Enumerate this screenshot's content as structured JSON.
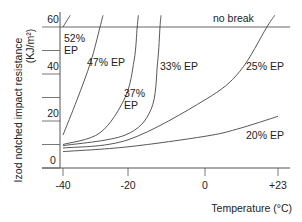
{
  "chart_data": {
    "type": "line",
    "title": "",
    "xlabel": "Temperature (°C)",
    "ylabel": "Izod notched impact resistance",
    "ylabel_unit": "(KJ/m²)",
    "x_ticks": [
      -40,
      -20,
      0,
      23
    ],
    "x_tick_labels": [
      "-40",
      "-20",
      "0",
      "+23"
    ],
    "y_ticks": [
      0,
      10,
      20,
      30,
      40,
      50,
      60
    ],
    "y_tick_labels": [
      "0",
      "",
      "20",
      "",
      "40",
      "",
      "60"
    ],
    "xlim": [
      -40,
      23
    ],
    "ylim": [
      0,
      60
    ],
    "grid": false,
    "legend": "none (inline labels)",
    "annotations": [
      {
        "text": "no break",
        "note": "horizontal line at 60 KJ/m² marks no-break threshold"
      }
    ],
    "series": [
      {
        "name": "52% EP",
        "label_lines": [
          "52%",
          "EP"
        ],
        "points": [
          [
            -40,
            60
          ],
          [
            -37.8,
            65
          ]
        ]
      },
      {
        "name": "47% EP",
        "label_lines": [
          "47% EP"
        ],
        "points": [
          [
            -40,
            14
          ],
          [
            -35.7,
            29
          ],
          [
            -31.5,
            45
          ],
          [
            -28.6,
            60
          ],
          [
            -27.7,
            65
          ]
        ]
      },
      {
        "name": "37% EP",
        "label_lines": [
          "37%",
          "EP"
        ],
        "points": [
          [
            -40,
            10
          ],
          [
            -28.6,
            15
          ],
          [
            -20.9,
            30
          ],
          [
            -18.4,
            46
          ],
          [
            -17.6,
            60
          ],
          [
            -17.3,
            65
          ]
        ]
      },
      {
        "name": "33% EP",
        "label_lines": [
          "33% EP"
        ],
        "points": [
          [
            -40,
            9.5
          ],
          [
            -20.9,
            14
          ],
          [
            -14,
            25
          ],
          [
            -12.3,
            45
          ],
          [
            -11.7,
            60
          ],
          [
            -11.4,
            65
          ]
        ]
      },
      {
        "name": "25% EP",
        "label_lines": [
          "25% EP"
        ],
        "points": [
          [
            -40,
            8.5
          ],
          [
            -20,
            12
          ],
          [
            0,
            29
          ],
          [
            10.9,
            41
          ],
          [
            19.5,
            60
          ],
          [
            22,
            65
          ]
        ]
      },
      {
        "name": "20% EP",
        "label_lines": [
          "20% EP"
        ],
        "points": [
          [
            -40,
            7
          ],
          [
            -20,
            9
          ],
          [
            0,
            13.5
          ],
          [
            10,
            16.5
          ],
          [
            23,
            22
          ]
        ]
      }
    ]
  },
  "labels": {
    "no_break": "no break",
    "x_axis_title": "Temperature (°C)",
    "y_axis_title": "Izod notched impact resistance",
    "y_axis_unit": "(KJ/m²)"
  },
  "colors": {
    "line": "#444444",
    "axis": "#555555",
    "text": "#222222"
  }
}
